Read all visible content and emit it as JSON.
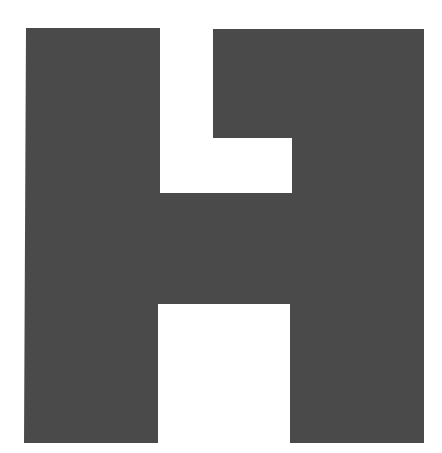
{
  "figure": {
    "letter": "H",
    "fill_color": "#4a4a4a",
    "background_color": "#ffffff"
  }
}
